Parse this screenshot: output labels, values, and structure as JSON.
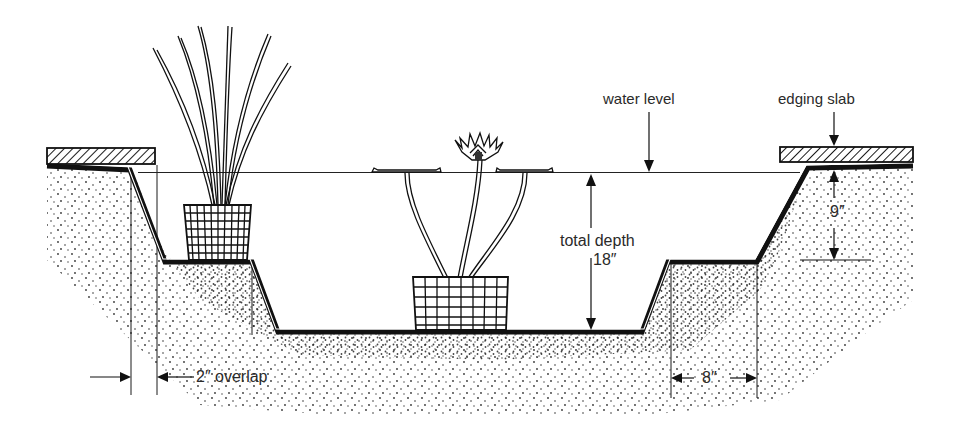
{
  "diagram": {
    "colors": {
      "ink": "#1a1a1a",
      "text": "#2a2a2a",
      "background": "#ffffff"
    },
    "labels": {
      "water_level": "water level",
      "edging_slab": "edging slab",
      "total_depth": "total depth",
      "total_depth_value": "18″",
      "shelf_depth_value": "9″",
      "overlap": "2″ overlap",
      "shelf_width_value": "8″"
    },
    "components": [
      {
        "id": "left-edging-slab",
        "kind": "edging slab"
      },
      {
        "id": "right-edging-slab",
        "kind": "edging slab"
      },
      {
        "id": "pond-liner",
        "kind": "liner profile"
      },
      {
        "id": "marginal-shelf-left",
        "kind": "shelf"
      },
      {
        "id": "marginal-shelf-right",
        "kind": "shelf"
      },
      {
        "id": "marginal-plant",
        "kind": "plant in basket"
      },
      {
        "id": "water-lily",
        "kind": "plant in basket"
      },
      {
        "id": "soil",
        "kind": "stippled ground"
      }
    ]
  }
}
